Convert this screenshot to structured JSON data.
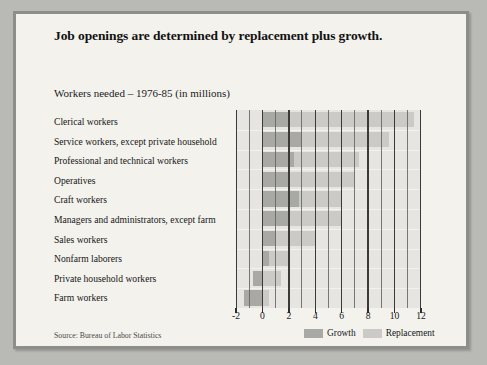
{
  "title": "Job openings are determined by replacement plus growth.",
  "subtitle": "Workers needed – 1976-85 (in millions)",
  "source": "Source: Bureau of Labor Statistics",
  "legend": {
    "growth_label": "Growth",
    "replacement_label": "Replacement"
  },
  "colors": {
    "growth": "#a8a8a4",
    "replacement": "#cbcac6",
    "plot_background": "#e6e5e1",
    "panel_background": "#f3f2ed",
    "frame_border": "#8d8d8a",
    "page_background": "#b9b9b6",
    "gridline": "#3a3a3a"
  },
  "chart_data": {
    "type": "bar",
    "orientation": "horizontal",
    "stacked": true,
    "title": "Job openings are determined by replacement plus growth.",
    "subtitle": "Workers needed – 1976-85 (in millions)",
    "xlabel": "",
    "ylabel": "",
    "units": "millions of workers",
    "xlim": [
      -2,
      12
    ],
    "xticks": [
      -2,
      0,
      2,
      4,
      6,
      8,
      10,
      12
    ],
    "xticklabels": [
      "-2",
      "0",
      "2",
      "4",
      "6",
      "8",
      "10",
      "12"
    ],
    "grid": "vertical",
    "legend_position": "bottom-right",
    "categories": [
      "Clerical workers",
      "Service workers, except private household",
      "Professional and technical workers",
      "Operatives",
      "Craft workers",
      "Managers and administrators, except farm",
      "Sales workers",
      "Nonfarm laborers",
      "Private household workers",
      "Farm workers"
    ],
    "series": [
      {
        "name": "Growth",
        "color": "#a8a8a4",
        "values": [
          2.0,
          3.0,
          2.4,
          2.0,
          2.8,
          2.0,
          1.0,
          0.5,
          -0.7,
          -1.4
        ]
      },
      {
        "name": "Replacement",
        "color": "#cbcac6",
        "values": [
          9.5,
          6.6,
          4.9,
          5.0,
          3.2,
          4.0,
          3.0,
          1.5,
          1.4,
          0.5
        ]
      }
    ],
    "totals": [
      11.5,
      9.6,
      7.3,
      7.0,
      6.0,
      6.0,
      4.0,
      2.0,
      0.7,
      -0.9
    ]
  }
}
